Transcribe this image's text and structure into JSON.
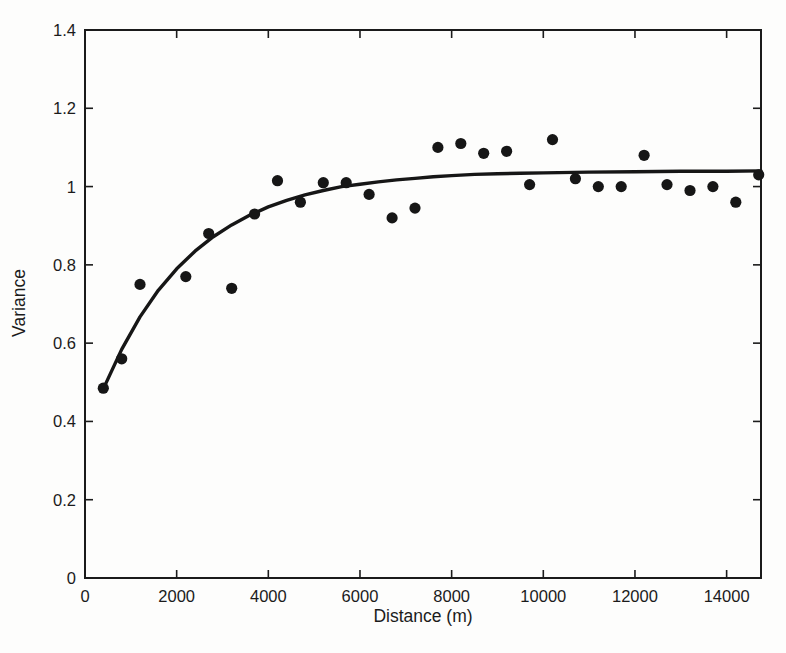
{
  "page": {
    "background": "#fdfdfc",
    "ink": "#1b1b1b"
  },
  "chart_data": {
    "type": "scatter",
    "title": "",
    "xlabel": "Distance (m)",
    "ylabel": "Variance",
    "xlim": [
      0,
      14750
    ],
    "ylim": [
      0,
      1.4
    ],
    "x_ticks": [
      0,
      2000,
      4000,
      6000,
      8000,
      10000,
      12000,
      14000
    ],
    "x_tick_labels": [
      "0",
      "2000",
      "4000",
      "6000",
      "8000",
      "10000",
      "12000",
      "14000"
    ],
    "y_ticks": [
      0,
      0.2,
      0.4,
      0.6,
      0.8,
      1.0,
      1.2,
      1.4
    ],
    "y_tick_labels": [
      "0",
      "0.2",
      "0.4",
      "0.6",
      "0.8",
      "1",
      "1.2",
      "1.4"
    ],
    "grid": false,
    "legend": "none",
    "frame": "box",
    "series": [
      {
        "name": "empirical-semivariance-points",
        "type": "scatter",
        "marker": "filled-circle",
        "marker_radius": 5.6,
        "color": "#161616",
        "points": [
          [
            400,
            0.485
          ],
          [
            800,
            0.56
          ],
          [
            1200,
            0.75
          ],
          [
            2200,
            0.77
          ],
          [
            2700,
            0.88
          ],
          [
            3200,
            0.74
          ],
          [
            3700,
            0.93
          ],
          [
            4200,
            1.015
          ],
          [
            4700,
            0.96
          ],
          [
            5200,
            1.01
          ],
          [
            5700,
            1.01
          ],
          [
            6200,
            0.98
          ],
          [
            6700,
            0.92
          ],
          [
            7200,
            0.945
          ],
          [
            7700,
            1.1
          ],
          [
            8200,
            1.11
          ],
          [
            8700,
            1.085
          ],
          [
            9200,
            1.09
          ],
          [
            9700,
            1.005
          ],
          [
            10200,
            1.12
          ],
          [
            10700,
            1.02
          ],
          [
            11200,
            1.0
          ],
          [
            11700,
            1.0
          ],
          [
            12200,
            1.08
          ],
          [
            12700,
            1.005
          ],
          [
            13200,
            0.99
          ],
          [
            13700,
            1.0
          ],
          [
            14200,
            0.96
          ],
          [
            14700,
            1.03
          ]
        ]
      },
      {
        "name": "fitted-variogram-model-curve",
        "type": "line",
        "color": "#161616",
        "line_width": 3.4,
        "model_description": "exponential rise to sill ~1.04 from ~0.48 at 400 m",
        "points": [
          [
            400,
            0.483
          ],
          [
            800,
            0.584
          ],
          [
            1200,
            0.667
          ],
          [
            1600,
            0.735
          ],
          [
            2000,
            0.79
          ],
          [
            2400,
            0.835
          ],
          [
            2800,
            0.872
          ],
          [
            3200,
            0.902
          ],
          [
            3600,
            0.927
          ],
          [
            4000,
            0.948
          ],
          [
            4400,
            0.965
          ],
          [
            4800,
            0.979
          ],
          [
            5200,
            0.99
          ],
          [
            5600,
            1.0
          ],
          [
            6000,
            1.006
          ],
          [
            6400,
            1.012
          ],
          [
            6800,
            1.017
          ],
          [
            7200,
            1.021
          ],
          [
            7600,
            1.025
          ],
          [
            8000,
            1.028
          ],
          [
            8500,
            1.031
          ],
          [
            9000,
            1.033
          ],
          [
            9500,
            1.034
          ],
          [
            10000,
            1.035
          ],
          [
            11000,
            1.037
          ],
          [
            12000,
            1.038
          ],
          [
            13000,
            1.039
          ],
          [
            14000,
            1.039
          ],
          [
            14750,
            1.04
          ]
        ]
      }
    ]
  }
}
